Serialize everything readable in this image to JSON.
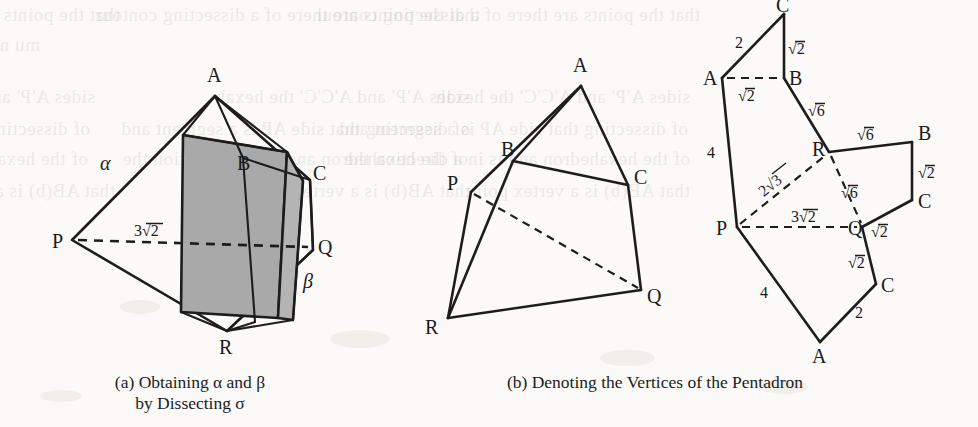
{
  "page": {
    "width": 978,
    "height": 427,
    "background_color": "#fbfaf8",
    "ink_color": "#1d1d1d",
    "shade_color": "#a9a9a9"
  },
  "bleed_through": [
    {
      "text": "that the points are there of a dissecting contour",
      "x": 120,
      "y": 14
    },
    {
      "text": "mu n",
      "x": 40,
      "y": 44
    },
    {
      "text": "sides A'P' and A'C'C' the hexah",
      "x": 95,
      "y": 96
    },
    {
      "text": "of dissecting that side AP is a segment and",
      "x": 90,
      "y": 128
    },
    {
      "text": "of the hexahedron and is in a direction the",
      "x": 88,
      "y": 158
    },
    {
      "text": "that AB(b) is a vertex point",
      "x": 115,
      "y": 190
    }
  ],
  "figures": [
    {
      "id": "fig-a",
      "name": "dissected-octahedron",
      "caption_lines": [
        "(a) Obtaining α and β",
        "by Dissecting σ"
      ],
      "caption_plain": "(a) Obtaining alpha and beta by Dissecting sigma",
      "vertex_labels": [
        "A",
        "B",
        "C",
        "P",
        "Q",
        "R"
      ],
      "region_labels": [
        "α",
        "β"
      ],
      "edge_labels": [
        "3√2"
      ],
      "vertices": {
        "A": {
          "x": 215,
          "y": 96
        },
        "B": {
          "x": 243,
          "y": 158
        },
        "C": {
          "x": 310,
          "y": 180
        },
        "P": {
          "x": 72,
          "y": 240
        },
        "Q": {
          "x": 313,
          "y": 250
        },
        "R": {
          "x": 227,
          "y": 331
        }
      }
    },
    {
      "id": "fig-b-solid",
      "name": "pentadron-solid",
      "vertex_labels": [
        "A",
        "B",
        "C",
        "P",
        "Q",
        "R"
      ],
      "vertices": {
        "A": {
          "x": 581,
          "y": 86
        },
        "B": {
          "x": 513,
          "y": 161
        },
        "C": {
          "x": 628,
          "y": 185
        },
        "P": {
          "x": 471,
          "y": 192
        },
        "Q": {
          "x": 641,
          "y": 290
        },
        "R": {
          "x": 448,
          "y": 318
        }
      }
    },
    {
      "id": "fig-b-net",
      "name": "pentadron-net",
      "caption_lines": [
        "(b) Denoting the Vertices of the Pentadron"
      ],
      "caption_plain": "(b) Denoting the Vertices of the Pentadron",
      "vertex_labels": [
        "C",
        "A",
        "B",
        "R",
        "B",
        "C",
        "P",
        "Q",
        "C",
        "A"
      ],
      "edge_labels": [
        "2",
        "√2",
        "√2",
        "√6",
        "√6",
        "√2",
        "4",
        "2√3",
        "√6",
        "3√2",
        "√2",
        "√2",
        "4",
        "2"
      ],
      "vertices": {
        "C_top": {
          "x": 784,
          "y": 14
        },
        "A_left": {
          "x": 722,
          "y": 78
        },
        "B_top": {
          "x": 784,
          "y": 78
        },
        "R": {
          "x": 829,
          "y": 152
        },
        "B_right": {
          "x": 912,
          "y": 142
        },
        "C_right": {
          "x": 912,
          "y": 200
        },
        "P": {
          "x": 737,
          "y": 227
        },
        "Q": {
          "x": 862,
          "y": 227
        },
        "C_low": {
          "x": 876,
          "y": 284
        },
        "A_bot": {
          "x": 820,
          "y": 342
        }
      }
    }
  ],
  "labels": {
    "A": "A",
    "B": "B",
    "C": "C",
    "P": "P",
    "Q": "Q",
    "R": "R",
    "alpha": "α",
    "beta": "β",
    "two": "2",
    "four": "4",
    "sqrt2": "√2",
    "sqrt6": "√6",
    "two_sqrt3": "2√3",
    "three_sqrt2": "3√2"
  },
  "captions": {
    "a_line1": "(a) Obtaining α and β",
    "a_line2": "by Dissecting σ",
    "b_line1": "(b) Denoting the Vertices of the Pentadron"
  }
}
